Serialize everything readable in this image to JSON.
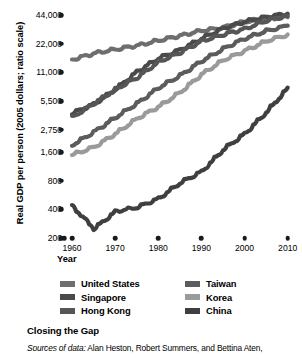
{
  "chart_data": {
    "type": "line",
    "title": "Closing the Gap",
    "xlabel": "Year",
    "ylabel": "Real GDP per person (2005 dollars; ratio scale)",
    "scale": "log",
    "grid": false,
    "legend_position": "bottom",
    "xlim": [
      1960,
      2011
    ],
    "ylim": [
      200,
      44000
    ],
    "xticks": [
      "1960",
      "1970",
      "1980",
      "1990",
      "2000",
      "2010"
    ],
    "xtick_values": [
      1960,
      1970,
      1980,
      1990,
      2000,
      2010
    ],
    "yticks": [
      "44,000",
      "22,000",
      "11,000",
      "5,500",
      "2,750",
      "1,600",
      "800",
      "400",
      "200"
    ],
    "ytick_values": [
      44000,
      22000,
      11000,
      5500,
      2750,
      1600,
      800,
      400,
      200
    ],
    "x": [
      1960,
      1965,
      1970,
      1975,
      1980,
      1985,
      1990,
      1995,
      2000,
      2005,
      2010
    ],
    "series": [
      {
        "name": "United States",
        "color": "#6e6e6e",
        "values": [
          15000,
          17400,
          19200,
          21000,
          23800,
          26700,
          30200,
          32500,
          37500,
          40500,
          41800
        ]
      },
      {
        "name": "Singapore",
        "color": "#4a4a4a",
        "values": [
          4100,
          5100,
          7300,
          11200,
          15500,
          19000,
          25000,
          32000,
          37500,
          42000,
          45500
        ]
      },
      {
        "name": "Hong Kong",
        "color": "#565656",
        "values": [
          3700,
          5200,
          7300,
          9700,
          14200,
          17800,
          23500,
          27500,
          31500,
          38500,
          43500
        ]
      },
      {
        "name": "Taiwan",
        "color": "#5c5c5c",
        "values": [
          1900,
          2600,
          3700,
          5200,
          7600,
          10200,
          14500,
          19500,
          25000,
          30000,
          34000
        ]
      },
      {
        "name": "Korea",
        "color": "#9a9a9a",
        "values": [
          1500,
          1800,
          2500,
          3600,
          4800,
          6800,
          10500,
          14800,
          18500,
          23500,
          27500
        ]
      },
      {
        "name": "China",
        "color": "#3f3f3f",
        "values": [
          430,
          250,
          380,
          420,
          520,
          760,
          1000,
          1700,
          2500,
          4200,
          7600
        ]
      }
    ]
  },
  "axis": {
    "y_title": "Real GDP per person (2005 dollars; ratio scale)",
    "x_title": "Year"
  },
  "legend": {
    "column_left": [
      {
        "label": "United States",
        "color": "#6e6e6e"
      },
      {
        "label": "Singapore",
        "color": "#4a4a4a"
      },
      {
        "label": "Hong Kong",
        "color": "#565656"
      }
    ],
    "column_right": [
      {
        "label": "Taiwan",
        "color": "#5c5c5c"
      },
      {
        "label": "Korea",
        "color": "#9a9a9a"
      },
      {
        "label": "China",
        "color": "#3f3f3f"
      }
    ]
  },
  "caption": {
    "title": "Closing the Gap",
    "source_prefix": "Sources of data:",
    "source_text": "Alan Heston, Robert Summers, and Bettina Aten,"
  }
}
